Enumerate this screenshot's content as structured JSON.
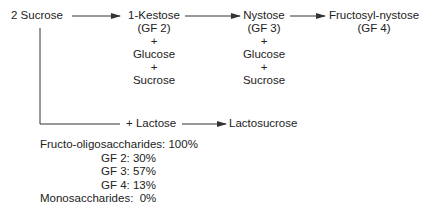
{
  "diagram": {
    "start": {
      "label": "2 Sucrose"
    },
    "chain": [
      {
        "name": "1-Kestose",
        "code": "(GF 2)",
        "plus1": "+",
        "by1": "Glucose",
        "plus2": "+",
        "by2": "Sucrose"
      },
      {
        "name": "Nystose",
        "code": "(GF 3)",
        "plus1": "+",
        "by1": "Glucose",
        "plus2": "+",
        "by2": "Sucrose"
      },
      {
        "name": "Fructosyl-nystose",
        "code": "(GF 4)"
      }
    ],
    "branch": {
      "reagent": "+ Lactose",
      "product": "Lactosucrose"
    },
    "summary": {
      "total": "Fructo-oligosaccharides: 100%",
      "gf2": "GF 2: 30%",
      "gf3": "GF 3: 57%",
      "gf4": "GF 4: 13%",
      "mono": "Monosaccharides:  0%"
    },
    "colors": {
      "line": "#333333",
      "text": "#222222",
      "background": "#ffffff"
    }
  }
}
